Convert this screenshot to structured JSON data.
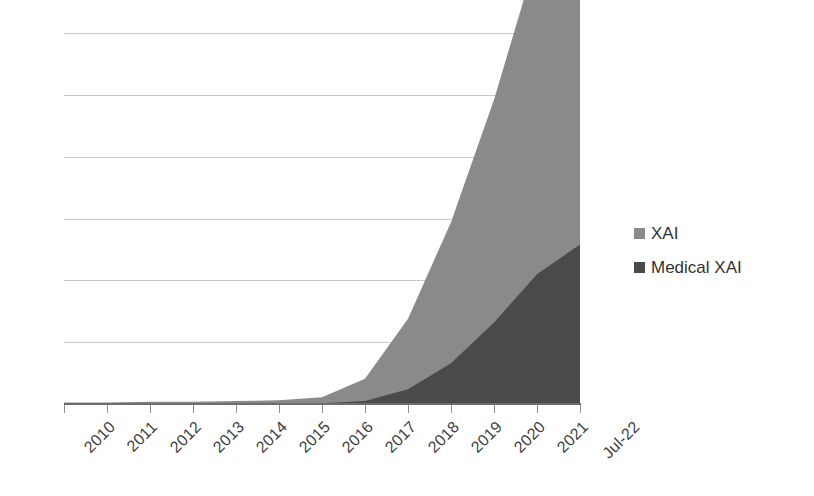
{
  "chart_data": {
    "type": "area",
    "stacked": true,
    "title": "",
    "subtitle": "",
    "xlabel": "",
    "ylabel": "",
    "categories": [
      "2010",
      "2011",
      "2012",
      "2013",
      "2014",
      "2015",
      "2016",
      "2017",
      "2018",
      "2019",
      "2020",
      "2021",
      "Jul-22"
    ],
    "series": [
      {
        "name": "XAI",
        "color": "#8a8a8a",
        "values": [
          2,
          2,
          3,
          3,
          4,
          5,
          8,
          30,
          95,
          190,
          300,
          430,
          355
        ]
      },
      {
        "name": "Medical XAI",
        "color": "#4a4a4a",
        "values": [
          0,
          0,
          0,
          0,
          0,
          0,
          1,
          4,
          20,
          55,
          110,
          175,
          215
        ]
      }
    ],
    "ylim": [
      0,
      500
    ],
    "yticks": [
      0,
      100,
      200,
      300,
      400,
      500,
      600
    ],
    "ytick_labels": [
      "",
      "",
      "",
      "",
      "",
      "",
      ""
    ],
    "gridlines": {
      "horizontal": true,
      "vertical": false,
      "color": "#c9c9c9",
      "count": 6
    },
    "legend": {
      "position": "right",
      "entries": [
        {
          "label": "XAI",
          "swatch_color": "#8a8a8a",
          "marker": "square-swatch"
        },
        {
          "label": "Medical XAI",
          "swatch_color": "#4a4a4a",
          "marker": "square-swatch"
        }
      ]
    },
    "axis": {
      "x_label_rotation_deg": -45,
      "x_axis_line_color": "#6e6e6e",
      "tick_color": "#8f8f8f",
      "y_axis_visible": false
    },
    "background_color": "#ffffff"
  }
}
